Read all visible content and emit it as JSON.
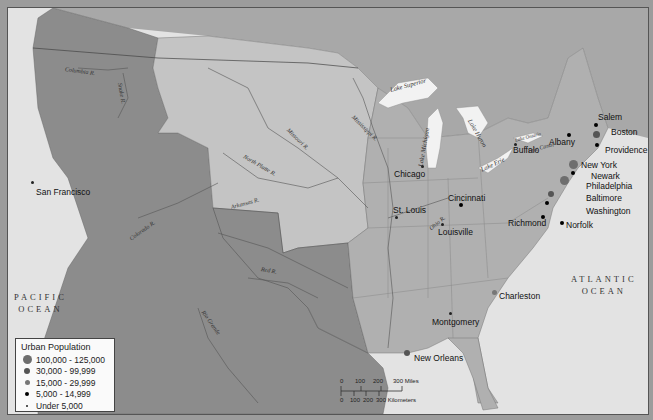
{
  "map": {
    "colors": {
      "ocean": "#e3e3e3",
      "territory_dark": "#8c8c8c",
      "territory_light": "#c4c4c4",
      "states": "#b0b0b0",
      "foreign": "#a8a8a8",
      "lakes": "#f2f2f2",
      "frame": "#9c9c9c"
    },
    "oceans": [
      {
        "line1": "PACIFIC",
        "line2": "OCEAN"
      },
      {
        "line1": "ATLANTIC",
        "line2": "OCEAN"
      }
    ],
    "rivers": [
      "Columbia R.",
      "Snake R.",
      "Missouri R.",
      "Mississippi R.",
      "North Platte R.",
      "Arkansas R.",
      "Colorado R.",
      "Red R.",
      "Rio Grande",
      "Ohio R."
    ],
    "lakes": [
      "Lake Superior",
      "Lake Michigan",
      "Lake Huron",
      "Lake Erie",
      "Lake Ontario"
    ],
    "canals": [
      "Erie Canal"
    ],
    "cities": [
      {
        "name": "Boston",
        "size": "30,000 - 99,999"
      },
      {
        "name": "Salem",
        "size": "5,000 - 14,999"
      },
      {
        "name": "Providence",
        "size": "5,000 - 14,999"
      },
      {
        "name": "Albany",
        "size": "5,000 - 14,999"
      },
      {
        "name": "Buffalo",
        "size": "Under 5,000"
      },
      {
        "name": "New York",
        "size": "100,000 - 125,000"
      },
      {
        "name": "Newark",
        "size": "5,000 - 14,999"
      },
      {
        "name": "Philadelphia",
        "size": "100,000 - 125,000"
      },
      {
        "name": "Baltimore",
        "size": "30,000 - 99,999"
      },
      {
        "name": "Washington",
        "size": "5,000 - 14,999"
      },
      {
        "name": "Richmond",
        "size": "5,000 - 14,999"
      },
      {
        "name": "Norfolk",
        "size": "5,000 - 14,999"
      },
      {
        "name": "Charleston",
        "size": "15,000 - 29,999"
      },
      {
        "name": "Chicago",
        "size": "Under 5,000"
      },
      {
        "name": "Cincinnati",
        "size": "5,000 - 14,999"
      },
      {
        "name": "Louisville",
        "size": "Under 5,000"
      },
      {
        "name": "St. Louis",
        "size": "Under 5,000"
      },
      {
        "name": "Montgomery",
        "size": "Under 5,000"
      },
      {
        "name": "New Orleans",
        "size": "30,000 - 99,999"
      },
      {
        "name": "San Francisco",
        "size": "Under 5,000"
      }
    ]
  },
  "legend": {
    "title": "Urban Population",
    "items": [
      {
        "label": "100,000 - 125,000",
        "size": 9,
        "color": "#6e6e6e"
      },
      {
        "label": "30,000 - 99,999",
        "size": 7,
        "color": "#555555"
      },
      {
        "label": "15,000 - 29,999",
        "size": 5,
        "color": "#777777"
      },
      {
        "label": "5,000 - 14,999",
        "size": 4,
        "color": "#000000"
      },
      {
        "label": "Under 5,000",
        "size": 2,
        "color": "#222222"
      }
    ]
  },
  "scale": {
    "miles_ticks": [
      "0",
      "100",
      "200",
      "300 Miles"
    ],
    "km_ticks": [
      "0",
      "100",
      "200",
      "300 Kilometers"
    ]
  }
}
